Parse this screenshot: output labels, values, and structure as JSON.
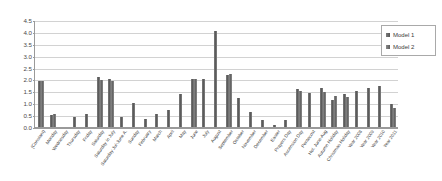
{
  "chart_data": {
    "type": "bar",
    "title": "",
    "xlabel": "",
    "ylabel": "",
    "ylim": [
      0.0,
      4.5
    ],
    "ytick_step": 0.5,
    "yticks": [
      "0.0",
      "0.5",
      "1.0",
      "1.5",
      "2.0",
      "2.5",
      "3.0",
      "3.5",
      "4.0",
      "4.5"
    ],
    "grid": true,
    "legend_position": "top-right",
    "categories": [
      "(Constant)",
      "Monday",
      "Wednesday",
      "Thursday",
      "Friday",
      "Saturday",
      "Saturday in July",
      "Saturday Jul-June A.",
      "Sunday",
      "February",
      "March",
      "April",
      "May",
      "June",
      "July",
      "August",
      "September",
      "October",
      "November",
      "December",
      "Easter",
      "Prayers Day",
      "Ascension Day",
      "Pentecost",
      "Hol. June-Aug",
      "Autumn Holiday",
      "Christmas Holiday",
      "Year 2008",
      "Year 2009",
      "Year 2010",
      "Year 2011"
    ],
    "series": [
      {
        "name": "Model 1",
        "color": "#5a5a5a",
        "values": [
          1.93,
          0.52,
          0.0,
          0.42,
          0.55,
          2.1,
          2.02,
          0.41,
          1.02,
          0.35,
          0.55,
          0.72,
          1.4,
          2.02,
          2.03,
          4.02,
          2.18,
          1.22,
          0.63,
          0.3,
          0.07,
          0.3,
          1.6,
          1.42,
          1.65,
          1.15,
          1.38,
          1.52,
          1.63,
          1.73,
          0.95
        ]
      },
      {
        "name": "Model 2",
        "color": "#6d6d6d",
        "values": [
          1.93,
          0.53,
          0.0,
          0.0,
          0.0,
          1.98,
          1.93,
          0.0,
          0.0,
          0.0,
          0.0,
          0.0,
          0.0,
          2.0,
          0.0,
          0.0,
          2.22,
          0.0,
          0.0,
          0.0,
          0.0,
          0.0,
          1.52,
          0.0,
          1.48,
          1.3,
          1.28,
          0.0,
          0.0,
          0.0,
          0.8
        ]
      }
    ],
    "legend": [
      "Model 1",
      "Model 2"
    ]
  },
  "legend": {
    "items": [
      {
        "label": "Model 1"
      },
      {
        "label": "Model 2"
      }
    ]
  }
}
